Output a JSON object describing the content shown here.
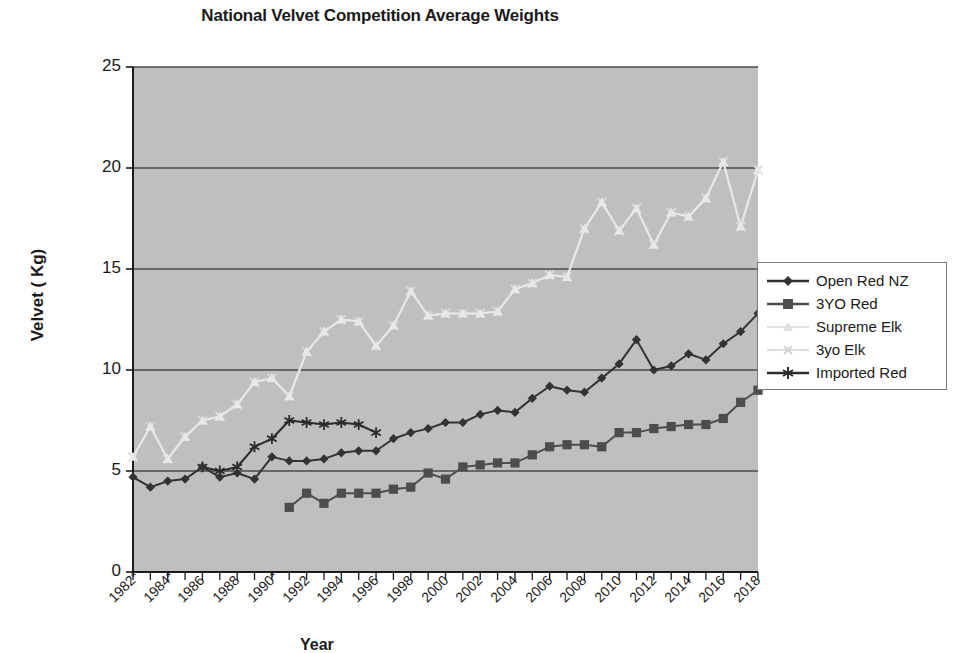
{
  "chart_data": {
    "type": "line",
    "title": "National Velvet Competition Average Weights",
    "xlabel": "Year",
    "ylabel": "Velvet ( Kg)",
    "ylim": [
      0,
      25
    ],
    "ytick_labels": [
      "0",
      "5",
      "10",
      "15",
      "20",
      "25"
    ],
    "ytick_values": [
      0,
      5,
      10,
      15,
      20,
      25
    ],
    "grid": "horizontal",
    "legend_position": "right",
    "plot_background": "#bfbfbf",
    "x": [
      1982,
      1983,
      1984,
      1985,
      1986,
      1987,
      1988,
      1989,
      1990,
      1991,
      1992,
      1993,
      1994,
      1995,
      1996,
      1997,
      1998,
      1999,
      2000,
      2001,
      2002,
      2003,
      2004,
      2005,
      2006,
      2007,
      2008,
      2009,
      2010,
      2011,
      2012,
      2013,
      2014,
      2015,
      2016,
      2017,
      2018
    ],
    "xtick_labels": [
      "1982*",
      "1984*",
      "1986",
      "1988",
      "1990*",
      "1992",
      "1994",
      "1996",
      "1998",
      "2000",
      "2002",
      "2004",
      "2006",
      "2008",
      "2010",
      "2012",
      "2014",
      "2016",
      "2018"
    ],
    "xtick_values": [
      1982,
      1984,
      1986,
      1988,
      1990,
      1992,
      1994,
      1996,
      1998,
      2000,
      2002,
      2004,
      2006,
      2008,
      2010,
      2012,
      2014,
      2016,
      2018
    ],
    "series": [
      {
        "name": "Open Red NZ",
        "color": "#333333",
        "marker": "diamond",
        "x": [
          1982,
          1983,
          1984,
          1985,
          1986,
          1987,
          1988,
          1989,
          1990,
          1991,
          1992,
          1993,
          1994,
          1995,
          1996,
          1997,
          1998,
          1999,
          2000,
          2001,
          2002,
          2003,
          2004,
          2005,
          2006,
          2007,
          2008,
          2009,
          2010,
          2011,
          2012,
          2013,
          2014,
          2015,
          2016,
          2017,
          2018
        ],
        "values": [
          4.7,
          4.2,
          4.5,
          4.6,
          5.2,
          4.7,
          4.9,
          4.6,
          5.7,
          5.5,
          5.5,
          5.6,
          5.9,
          6.0,
          6.0,
          6.6,
          6.9,
          7.1,
          7.4,
          7.4,
          7.8,
          8.0,
          7.9,
          8.6,
          9.2,
          9.0,
          8.9,
          9.6,
          10.3,
          11.5,
          10.0,
          10.2,
          10.8,
          10.5,
          11.3,
          11.9,
          12.8
        ]
      },
      {
        "name": "3YO Red",
        "color": "#4d4d4d",
        "marker": "square",
        "x": [
          1991,
          1992,
          1993,
          1994,
          1995,
          1996,
          1997,
          1998,
          1999,
          2000,
          2001,
          2002,
          2003,
          2004,
          2005,
          2006,
          2007,
          2008,
          2009,
          2010,
          2011,
          2012,
          2013,
          2014,
          2015,
          2016,
          2017,
          2018
        ],
        "values": [
          3.2,
          3.9,
          3.4,
          3.9,
          3.9,
          3.9,
          4.1,
          4.2,
          4.9,
          4.6,
          5.2,
          5.3,
          5.4,
          5.4,
          5.8,
          6.2,
          6.3,
          6.3,
          6.2,
          6.9,
          6.9,
          7.1,
          7.2,
          7.3,
          7.3,
          7.6,
          8.4,
          9.0
        ]
      },
      {
        "name": "Supreme Elk",
        "color": "#e8e8e8",
        "marker": "triangle",
        "x": [
          1982,
          1983,
          1984,
          1985,
          1986,
          1987,
          1988,
          1989,
          1990,
          1991,
          1992,
          1993,
          1994,
          1995,
          1996,
          1997,
          1998,
          1999,
          2000,
          2001,
          2002,
          2003,
          2004,
          2005,
          2006,
          2007,
          2008,
          2009,
          2010,
          2011,
          2012,
          2013,
          2014,
          2015,
          2016,
          2017,
          2018
        ],
        "values": [
          5.7,
          7.2,
          5.6,
          6.7,
          7.5,
          7.7,
          8.3,
          9.4,
          9.6,
          8.7,
          10.9,
          11.9,
          12.5,
          12.4,
          11.2,
          12.2,
          13.9,
          12.7,
          12.8,
          12.8,
          12.8,
          12.9,
          14.0,
          14.3,
          14.7,
          14.6,
          17.0,
          18.3,
          16.9,
          18.0,
          16.2,
          17.8,
          17.6,
          18.5,
          20.3,
          17.1,
          19.9
        ]
      },
      {
        "name": "3yo Elk",
        "color": "#d9d9d9",
        "marker": "x",
        "x": [
          1982,
          1983,
          1984,
          1985,
          1986,
          1987,
          1988,
          1989,
          1990,
          1991,
          1992,
          1993,
          1994,
          1995,
          1996,
          1997,
          1998,
          1999,
          2000,
          2001,
          2002,
          2003,
          2004,
          2005,
          2006,
          2007,
          2008,
          2009,
          2010,
          2011,
          2012,
          2013,
          2014,
          2015,
          2016,
          2017,
          2018
        ],
        "values": [
          5.7,
          7.2,
          5.6,
          6.7,
          7.5,
          7.7,
          8.3,
          9.4,
          9.6,
          8.7,
          10.9,
          11.9,
          12.5,
          12.4,
          11.2,
          12.2,
          13.9,
          12.7,
          12.8,
          12.8,
          12.8,
          12.9,
          14.0,
          14.3,
          14.7,
          14.6,
          17.0,
          18.3,
          16.9,
          18.0,
          16.2,
          17.8,
          17.6,
          18.5,
          20.3,
          17.1,
          19.9
        ]
      },
      {
        "name": "Imported Red",
        "color": "#2b2b2b",
        "marker": "asterisk",
        "x": [
          1986,
          1987,
          1988,
          1989,
          1990,
          1991,
          1992,
          1993,
          1994,
          1995,
          1996
        ],
        "values": [
          5.2,
          5.0,
          5.2,
          6.2,
          6.6,
          7.5,
          7.4,
          7.3,
          7.4,
          7.3,
          6.9
        ]
      }
    ]
  },
  "legend": {
    "items": [
      {
        "label": "Open Red NZ"
      },
      {
        "label": "3YO Red"
      },
      {
        "label": "Supreme Elk"
      },
      {
        "label": "3yo Elk"
      },
      {
        "label": "Imported Red"
      }
    ]
  }
}
